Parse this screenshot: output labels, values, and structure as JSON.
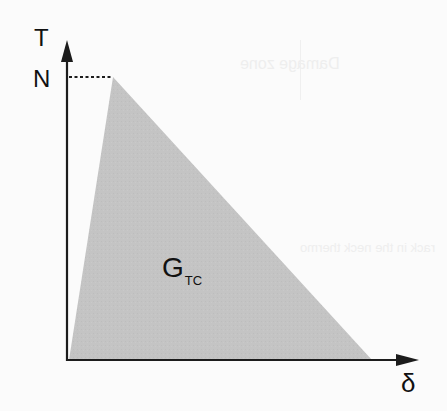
{
  "diagram": {
    "type": "traction-separation law (bilinear cohesive triangle)",
    "axes": {
      "y_label": "T",
      "x_label": "δ",
      "peak_label": "N"
    },
    "shaded_region": {
      "label_main": "G",
      "label_sub": "TC",
      "fill": "#c4c4c4"
    },
    "colors": {
      "axis": "#1c1c1c",
      "fill": "#c4c4c4",
      "background": "#fbfbfb",
      "dashed_line": "#1c1c1c"
    },
    "geometry": {
      "origin": [
        67,
        360
      ],
      "peak": [
        113,
        77
      ],
      "end": [
        372,
        360
      ]
    }
  },
  "background_ghost_text": {
    "line1": "Damage zone",
    "line2": "true fracture",
    "line3": "rack in the neck thermo"
  }
}
